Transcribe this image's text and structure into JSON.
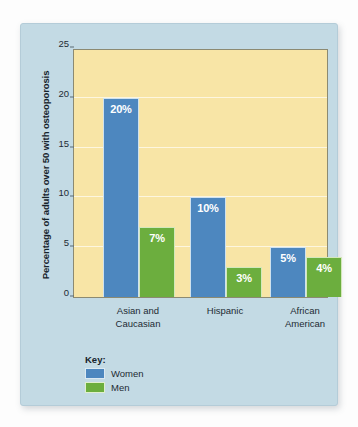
{
  "chart_data": {
    "type": "bar",
    "title": "",
    "xlabel": "",
    "ylabel": "Percentage of adults over 50 with osteoporosis",
    "ylim": [
      0,
      25
    ],
    "yticks": [
      0,
      5,
      10,
      15,
      20,
      25
    ],
    "ytick_labels": [
      "0",
      "5",
      "10",
      "15",
      "20",
      "25"
    ],
    "grid": true,
    "grid_axis": "y",
    "legend_position": "bottom-left",
    "categories": [
      "Asian and Caucasian",
      "Hispanic",
      "African American"
    ],
    "category_lines": [
      [
        "Asian and",
        "Caucasian"
      ],
      [
        "Hispanic",
        ""
      ],
      [
        "African",
        "American"
      ]
    ],
    "series": [
      {
        "name": "Women",
        "color": "#4d87bf",
        "values": [
          20,
          10,
          5
        ],
        "data_labels": [
          "20%",
          "10%",
          "5%"
        ]
      },
      {
        "name": "Men",
        "color": "#6cae3e",
        "values": [
          7,
          3,
          4
        ],
        "data_labels": [
          "7%",
          "3%",
          "4%"
        ]
      }
    ]
  },
  "legend": {
    "title": "Key:",
    "entries": [
      {
        "label": "Women",
        "color": "#4d87bf"
      },
      {
        "label": "Men",
        "color": "#6cae3e"
      }
    ]
  },
  "colors": {
    "card_background": "#c3dae4",
    "plot_background": "#f8e5a6",
    "gridline": "#fdf6df",
    "axis": "#8c8a72",
    "text": "#1d2a33",
    "women": "#4d87bf",
    "men": "#6cae3e"
  }
}
